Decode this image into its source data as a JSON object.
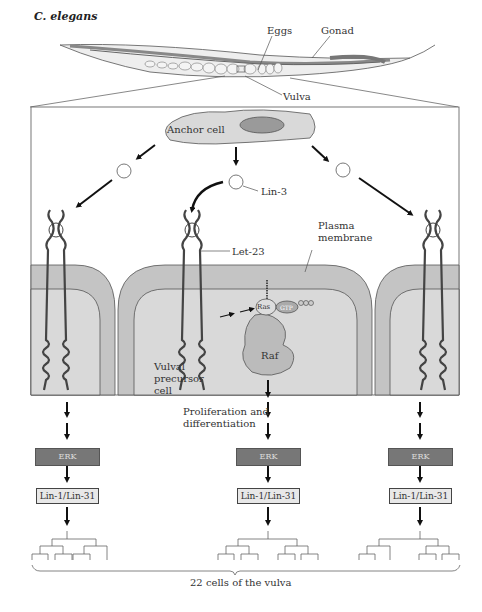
{
  "title": "C. elegans",
  "worm_labels": {
    "eggs": "Eggs",
    "gonad": "Gonad",
    "vulva": "Vulva"
  },
  "cell_labels": {
    "anchor_cell": "Anchor cell",
    "lin3": "Lin-3",
    "let23": "Let-23",
    "plasma_membrane_1": "Plasma",
    "plasma_membrane_2": "membrane",
    "vpc_1": "Vulval",
    "vpc_2": "precursor",
    "vpc_3": "cell",
    "ras": "Ras",
    "gtp": "GTP",
    "raf": "Raf"
  },
  "process": {
    "line1": "Proliferation and",
    "line2": "differentiation"
  },
  "pathway": [
    {
      "erk": "ERK",
      "lin": "Lin-1/Lin-31"
    },
    {
      "erk": "ERK",
      "lin": "Lin-1/Lin-31"
    },
    {
      "erk": "ERK",
      "lin": "Lin-1/Lin-31"
    }
  ],
  "footer": "22 cells of the vulva",
  "colors": {
    "cell_fill": "#d9d9d9",
    "membrane_fill": "#c4c4c4",
    "erk_fill": "#777777",
    "lin_fill": "#e8e8e8"
  }
}
